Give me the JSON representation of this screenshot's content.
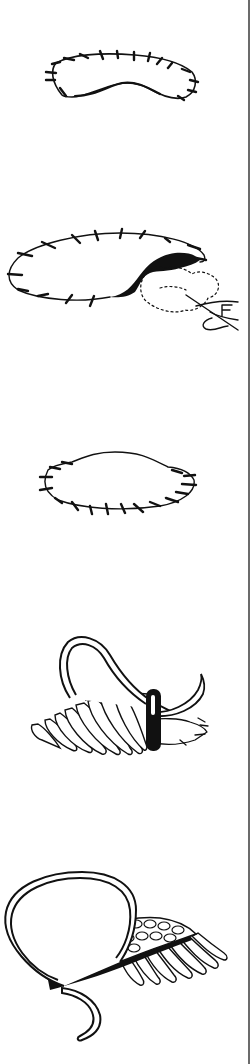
{
  "page": {
    "ink_color": "#111111",
    "background_color": "#ffffff",
    "border_color": "#6b6b6b"
  },
  "figures": [
    {
      "id": 1,
      "subject": "kidney-shaped outline with short tacking stitches around edge"
    },
    {
      "id": 2,
      "subject": "oval outline with tacking stitches, filled shaded corner, dotted padding shape and hand with needle"
    },
    {
      "id": 3,
      "subject": "oval outline with stitches along lower edge, smooth raised top"
    },
    {
      "id": 4,
      "subject": "padded shape being covered with satin stitches, needle and looped thread"
    },
    {
      "id": 5,
      "subject": "completed satin-stitched padded shape with woven top and looped thread"
    }
  ]
}
